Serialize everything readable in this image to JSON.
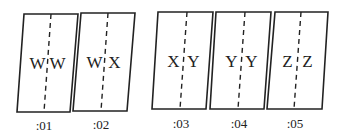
{
  "panels": [
    {
      "label": ":01",
      "left": "W",
      "right": "W",
      "pts": [
        [
          24,
          14
        ],
        [
          78,
          14
        ],
        [
          70,
          112
        ],
        [
          17,
          112
        ]
      ],
      "dash": [
        [
          51,
          14
        ],
        [
          44,
          112
        ]
      ],
      "lx": 44,
      "ly": 122
    },
    {
      "label": ":02",
      "left": "W",
      "right": "X",
      "pts": [
        [
          81,
          13
        ],
        [
          135,
          13
        ],
        [
          127,
          111
        ],
        [
          73,
          111
        ]
      ],
      "dash": [
        [
          108,
          13
        ],
        [
          101,
          111
        ]
      ],
      "lx": 101,
      "ly": 121
    },
    {
      "label": ":03",
      "left": "X",
      "right": "Y",
      "pts": [
        [
          158,
          12
        ],
        [
          213,
          12
        ],
        [
          206,
          109
        ],
        [
          152,
          109
        ]
      ],
      "dash": [
        [
          187,
          12
        ],
        [
          180,
          109
        ]
      ],
      "lx": 181,
      "ly": 120
    },
    {
      "label": ":04",
      "left": "Y",
      "right": "Y",
      "pts": [
        [
          216,
          12
        ],
        [
          271,
          12
        ],
        [
          264,
          109
        ],
        [
          210,
          109
        ]
      ],
      "dash": [
        [
          245,
          12
        ],
        [
          238,
          109
        ]
      ],
      "lx": 239,
      "ly": 120
    },
    {
      "label": ":05",
      "left": "Z",
      "right": "Z",
      "pts": [
        [
          275,
          12
        ],
        [
          328,
          12
        ],
        [
          322,
          109
        ],
        [
          267,
          109
        ]
      ],
      "dash": [
        [
          301,
          12
        ],
        [
          294,
          109
        ]
      ],
      "lx": 295,
      "ly": 120
    }
  ],
  "stroke_color": "#222222"
}
